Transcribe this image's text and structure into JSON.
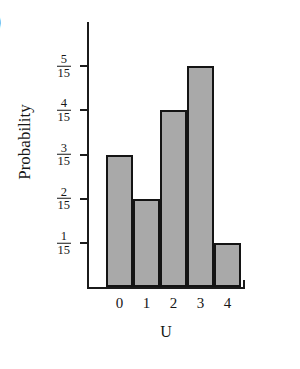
{
  "corner_label": ")",
  "chart_data": {
    "type": "bar",
    "title": "",
    "subtitle": "",
    "xlabel": "U",
    "ylabel": "Probability",
    "categories": [
      "0",
      "1",
      "2",
      "3",
      "4"
    ],
    "values": [
      0.2,
      0.13333,
      0.26667,
      0.33333,
      0.06667
    ],
    "value_labels": [
      "3/15",
      "2/15",
      "4/15",
      "5/15",
      "1/15"
    ],
    "ylim": [
      0,
      0.4
    ],
    "ytick_values": [
      0.06667,
      0.13333,
      0.2,
      0.26667,
      0.33333
    ],
    "ytick_labels": [
      {
        "num": "1",
        "den": "15"
      },
      {
        "num": "2",
        "den": "15"
      },
      {
        "num": "3",
        "den": "15"
      },
      {
        "num": "4",
        "den": "15"
      },
      {
        "num": "5",
        "den": "15"
      }
    ],
    "grid": false,
    "legend": null,
    "bar_fill_color": "#a9a9a9",
    "bar_edge_color": "#141414",
    "axis_color": "#1b1b1b",
    "background_color": "#ffffff",
    "contiguous_bars": true
  }
}
